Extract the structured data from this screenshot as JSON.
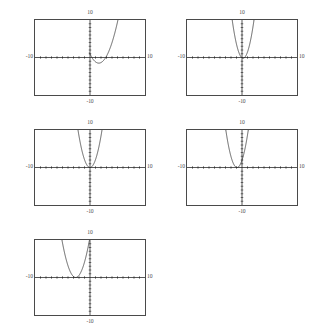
{
  "page": {
    "background_color": "#ffffff",
    "frame_color": "#4a4a4a",
    "curve_color": "#2a2a2a",
    "axis_color": "#1a1a1a",
    "plot_count": 5
  },
  "chart_data": [
    {
      "type": "line",
      "title": "",
      "xlabel": "",
      "ylabel": "",
      "xlim": [
        -10,
        10
      ],
      "ylim": [
        -10,
        10
      ],
      "grid": false,
      "legend": null,
      "axis_labels": {
        "top": "10",
        "bottom": "-10",
        "left": "-10",
        "right": "10"
      },
      "tick_spacing": 1,
      "curve": {
        "shape": "parabola",
        "opens": "up",
        "vertex": [
          1.6,
          -1.5
        ],
        "a": 0.95,
        "x_range": [
          -0.1,
          5.2
        ]
      }
    },
    {
      "type": "line",
      "title": "",
      "xlabel": "",
      "ylabel": "",
      "xlim": [
        -10,
        10
      ],
      "ylim": [
        -10,
        10
      ],
      "grid": false,
      "legend": null,
      "axis_labels": {
        "top": "10",
        "bottom": "-10",
        "left": "-10",
        "right": "10"
      },
      "tick_spacing": 1,
      "curve": {
        "shape": "parabola",
        "opens": "up",
        "vertex": [
          0.2,
          -0.2
        ],
        "a": 2.6,
        "x_range": [
          -2.2,
          2.4
        ]
      }
    },
    {
      "type": "line",
      "title": "",
      "xlabel": "",
      "ylabel": "",
      "xlim": [
        -10,
        10
      ],
      "ylim": [
        -10,
        10
      ],
      "grid": false,
      "legend": null,
      "axis_labels": {
        "top": "10",
        "bottom": "-10",
        "left": "-10",
        "right": "10"
      },
      "tick_spacing": 1,
      "curve": {
        "shape": "parabola",
        "opens": "up",
        "vertex": [
          0.0,
          0.0
        ],
        "a": 2.1,
        "x_range": [
          -2.4,
          2.4
        ]
      }
    },
    {
      "type": "line",
      "title": "",
      "xlabel": "",
      "ylabel": "",
      "xlim": [
        -10,
        10
      ],
      "ylim": [
        -10,
        10
      ],
      "grid": false,
      "legend": null,
      "axis_labels": {
        "top": "10",
        "bottom": "-10",
        "left": "-10",
        "right": "10"
      },
      "tick_spacing": 1,
      "curve": {
        "shape": "parabola",
        "opens": "up",
        "vertex": [
          -0.9,
          0.0
        ],
        "a": 2.4,
        "x_range": [
          -3.3,
          1.5
        ]
      }
    },
    {
      "type": "line",
      "title": "",
      "xlabel": "",
      "ylabel": "",
      "xlim": [
        -10,
        10
      ],
      "ylim": [
        -10,
        10
      ],
      "grid": false,
      "legend": null,
      "axis_labels": {
        "top": "10",
        "bottom": "-10",
        "left": "-10",
        "right": "10"
      },
      "tick_spacing": 1,
      "curve": {
        "shape": "parabola",
        "opens": "up",
        "vertex": [
          -2.6,
          0.0
        ],
        "a": 1.6,
        "x_range": [
          -5.3,
          0.2
        ]
      }
    }
  ]
}
